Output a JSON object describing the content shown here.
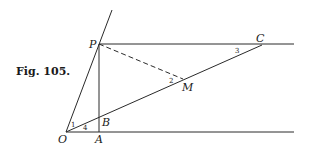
{
  "caption": "Fig. 105.",
  "points": {
    "O": "O",
    "P": "P",
    "A": "A",
    "B": "B",
    "C": "C",
    "M": "M"
  },
  "angles": {
    "a1": "1",
    "a2": "2",
    "a3": "3",
    "a4": "4"
  },
  "colors": {
    "line": "#2a2a2a",
    "background": "#ffffff"
  }
}
